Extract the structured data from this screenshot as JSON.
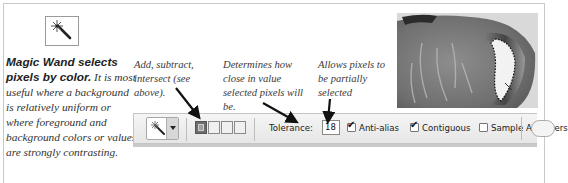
{
  "tool": {
    "name": "Magic Wand",
    "icon": "magic-wand-icon"
  },
  "caption": {
    "bold": "Magic Wand selects pixels by color.",
    "text": " It is most useful where a background is relatively uniform or where foreground and background colors or values are strongly contrasting."
  },
  "notes": [
    {
      "text": "Add, subtract, intersect (see above)."
    },
    {
      "text": "Determines how close in value selected pixels will be."
    },
    {
      "text": "Allows pixels to be partially selected"
    }
  ],
  "toolbar": {
    "preset_icon": "magic-wand-icon",
    "selection_modes": [
      {
        "name": "new-selection",
        "active": true
      },
      {
        "name": "add-to-selection",
        "active": false
      },
      {
        "name": "subtract-from-selection",
        "active": false
      },
      {
        "name": "intersect-with-selection",
        "active": false
      }
    ],
    "tolerance_label": "Tolerance:",
    "tolerance_value": "18",
    "anti_alias": {
      "label": "Anti-alias",
      "checked": true
    },
    "contiguous": {
      "label": "Contiguous",
      "checked": true
    },
    "sample_all_layers": {
      "label": "Sample All Layers",
      "checked": false
    }
  },
  "photo": {
    "description": "Grayscale pottery vessel with marching-ants selection around handle opening"
  }
}
